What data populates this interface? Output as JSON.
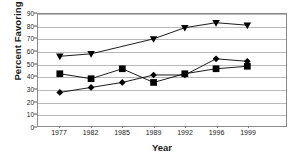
{
  "chart_data": {
    "type": "line",
    "title": "",
    "xlabel": "Year",
    "ylabel": "Percent Favoring",
    "categories": [
      "1977",
      "1982",
      "1985",
      "1989",
      "1992",
      "1996",
      "1999"
    ],
    "ylim": [
      0,
      90
    ],
    "ytick_labels": [
      "0",
      "10",
      "20",
      "30",
      "40",
      "50",
      "60",
      "70",
      "80",
      "90"
    ],
    "ytick_values": [
      0,
      10,
      20,
      30,
      40,
      50,
      60,
      70,
      80,
      90
    ],
    "grid": true,
    "legend": "none",
    "series": [
      {
        "name": "series-triangle",
        "marker": "triangle-down",
        "color": "#000000",
        "values": [
          56,
          58,
          null,
          70,
          79,
          83,
          81
        ]
      },
      {
        "name": "series-square",
        "marker": "square",
        "color": "#000000",
        "values": [
          42,
          38,
          46,
          35,
          42,
          46,
          48
        ]
      },
      {
        "name": "series-diamond",
        "marker": "diamond",
        "color": "#000000",
        "values": [
          27,
          31,
          35,
          41,
          41,
          54,
          52
        ]
      }
    ]
  }
}
